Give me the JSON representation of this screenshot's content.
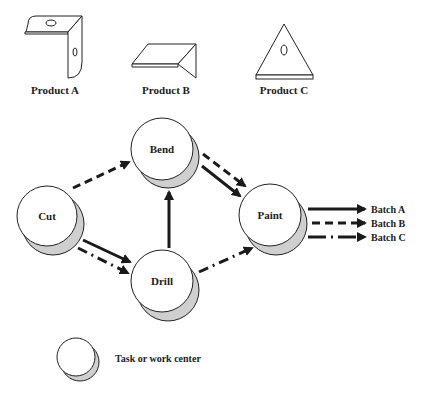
{
  "products": [
    {
      "id": "A",
      "label": "Product A",
      "icon": "angle-bracket-icon"
    },
    {
      "id": "B",
      "label": "Product B",
      "icon": "bent-plate-icon"
    },
    {
      "id": "C",
      "label": "Product C",
      "icon": "triangle-plate-icon"
    }
  ],
  "nodes": [
    {
      "id": "cut",
      "label": "Cut"
    },
    {
      "id": "bend",
      "label": "Bend"
    },
    {
      "id": "drill",
      "label": "Drill"
    },
    {
      "id": "paint",
      "label": "Paint"
    }
  ],
  "edges": [
    {
      "from": "Cut",
      "to": "Bend",
      "style": "dashed",
      "batch": "B"
    },
    {
      "from": "Cut",
      "to": "Drill",
      "style": "solid",
      "batch": "A"
    },
    {
      "from": "Cut",
      "to": "Drill",
      "style": "dash-dot",
      "batch": "C"
    },
    {
      "from": "Drill",
      "to": "Bend",
      "style": "solid",
      "batch": "A"
    },
    {
      "from": "Bend",
      "to": "Paint",
      "style": "solid",
      "batch": "A"
    },
    {
      "from": "Bend",
      "to": "Paint",
      "style": "dashed",
      "batch": "B"
    },
    {
      "from": "Drill",
      "to": "Paint",
      "style": "dash-dot",
      "batch": "C"
    }
  ],
  "outputs": [
    {
      "label": "Batch A",
      "style": "solid"
    },
    {
      "label": "Batch B",
      "style": "dashed"
    },
    {
      "label": "Batch C",
      "style": "dash-dot"
    }
  ],
  "legend": {
    "label": "Task or work center"
  },
  "colors": {
    "stroke": "#1a1a1a",
    "shadow": "#cfcfcf",
    "fill": "#ffffff"
  }
}
